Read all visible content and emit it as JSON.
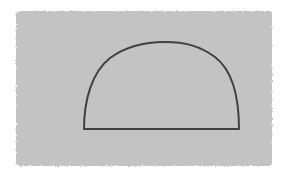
{
  "diagram": {
    "background_color": "#ffffff",
    "panel": {
      "shape": "rectangle",
      "fill": "#c3c3c3",
      "x": 16,
      "y": 11,
      "width": 256,
      "height": 155
    },
    "figure": {
      "shape": "semicircle",
      "stroke": "#404040",
      "stroke_width": 2,
      "fill": "none",
      "base_left": [
        84,
        129
      ],
      "base_right": [
        239,
        129
      ],
      "apex": [
        165,
        42
      ]
    }
  }
}
